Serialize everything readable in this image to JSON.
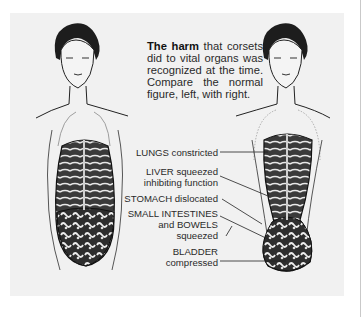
{
  "caption": {
    "bold_lead": "The harm",
    "rest": " that corsets did to vital organs was recognized at the time. Compare the normal figure, left, with right."
  },
  "figures": {
    "left": "normal-figure-illustration",
    "right": "corseted-figure-illustration"
  },
  "labels": [
    {
      "id": "lungs",
      "lines": [
        "LUNGS constricted"
      ]
    },
    {
      "id": "liver",
      "lines": [
        "LIVER squeezed",
        "inhibiting function"
      ]
    },
    {
      "id": "stomach",
      "lines": [
        "STOMACH dislocated"
      ]
    },
    {
      "id": "intestines",
      "lines": [
        "SMALL INTESTINES",
        "and BOWELS",
        "squeezed"
      ]
    },
    {
      "id": "bladder",
      "lines": [
        "BLADDER",
        "compressed"
      ]
    }
  ],
  "colors": {
    "panel_bg": "#f1f1f1",
    "ink": "#1a1a1a",
    "text": "#2a2a2a"
  }
}
